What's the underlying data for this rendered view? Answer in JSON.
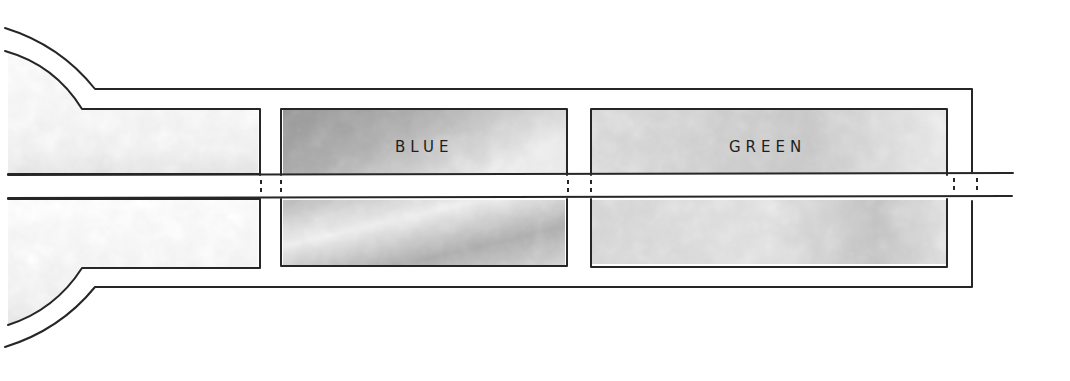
{
  "diagram": {
    "title": "",
    "style": "hand-drawn ink and watercolor wash",
    "colors": {
      "ink": "#262626",
      "background": "#ffffff",
      "wash_dark": "#9a9a9a",
      "wash_mid": "#c4c4c4",
      "wash_light": "#e2e2e2"
    },
    "compartments": [
      {
        "id": "left-bulb-chamber",
        "label": ""
      },
      {
        "id": "blue-chamber",
        "label": "BLUE"
      },
      {
        "id": "green-chamber",
        "label": "GREEN"
      }
    ],
    "channel": {
      "description": "horizontal channel running through all chambers"
    },
    "barriers": {
      "description": "dashed barriers where channel crosses chamber walls",
      "count": 6
    }
  }
}
